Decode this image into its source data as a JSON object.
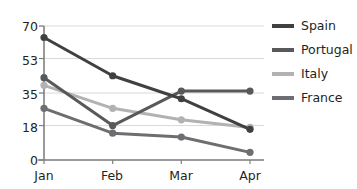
{
  "chart_data": {
    "type": "line",
    "title": "",
    "xlabel": "",
    "ylabel": "",
    "categories": [
      "Jan",
      "Feb",
      "Mar",
      "Apr"
    ],
    "ylim": [
      0,
      70
    ],
    "yticks": [
      0,
      18,
      35,
      53,
      70
    ],
    "grid": true,
    "legend_position": "right",
    "markers": true,
    "series": [
      {
        "name": "Spain",
        "values": [
          64,
          44,
          32,
          16
        ],
        "color": "#404040"
      },
      {
        "name": "Portugal",
        "values": [
          43,
          18,
          36,
          36
        ],
        "color": "#58595b"
      },
      {
        "name": "Italy",
        "values": [
          39,
          27,
          21,
          17
        ],
        "color": "#b2b2b2"
      },
      {
        "name": "France",
        "values": [
          27,
          14,
          12,
          4
        ],
        "color": "#6d6e71"
      }
    ]
  },
  "axis": {
    "y_tick_labels": [
      "70",
      "53",
      "35",
      "18",
      "0"
    ],
    "x_tick_labels": [
      "Jan",
      "Feb",
      "Mar",
      "Apr"
    ]
  },
  "legend": {
    "items": [
      {
        "label": "Spain"
      },
      {
        "label": "Portugal"
      },
      {
        "label": "Italy"
      },
      {
        "label": "France"
      }
    ]
  },
  "colors": {
    "background": "#ffffff",
    "grid": "#d9d9d9",
    "axis": "#808080",
    "text": "#231f20"
  }
}
